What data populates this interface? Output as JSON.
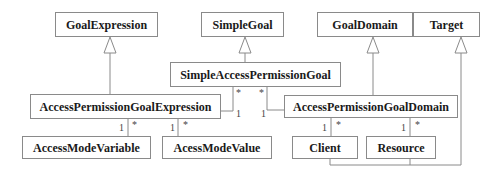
{
  "diagram": {
    "type": "uml-class-diagram",
    "classes": [
      {
        "id": "goal_expression",
        "name": "GoalExpression"
      },
      {
        "id": "simple_goal",
        "name": "SimpleGoal"
      },
      {
        "id": "goal_domain",
        "name": "GoalDomain"
      },
      {
        "id": "target",
        "name": "Target"
      },
      {
        "id": "simple_access_permission_goal",
        "name": "SimpleAccessPermissionGoal"
      },
      {
        "id": "access_permission_goal_expression",
        "name": "AccessPermissionGoalExpression"
      },
      {
        "id": "access_permission_goal_domain",
        "name": "AccessPermissionGoalDomain"
      },
      {
        "id": "access_mode_variable",
        "name": "AccessModeVariable"
      },
      {
        "id": "access_mode_value",
        "name": "AcessModeValue"
      },
      {
        "id": "client",
        "name": "Client"
      },
      {
        "id": "resource",
        "name": "Resource"
      }
    ],
    "generalizations": [
      {
        "child": "AccessPermissionGoalExpression",
        "parent": "GoalExpression"
      },
      {
        "child": "SimpleAccessPermissionGoal",
        "parent": "SimpleGoal"
      },
      {
        "child": "AccessPermissionGoalDomain",
        "parent": "GoalDomain"
      },
      {
        "child": "Client",
        "parent": "Target"
      },
      {
        "child": "Resource",
        "parent": "Target"
      }
    ],
    "associations": [
      {
        "from": "SimpleAccessPermissionGoal",
        "to": "AccessPermissionGoalExpression",
        "mult_near_from": "*",
        "mult_near_to": "1"
      },
      {
        "from": "SimpleAccessPermissionGoal",
        "to": "AccessPermissionGoalDomain",
        "mult_near_from": "*",
        "mult_near_to": "1"
      },
      {
        "from": "AccessPermissionGoalExpression",
        "to": "AccessModeVariable",
        "mult_left": "1",
        "mult_right": "*"
      },
      {
        "from": "AccessPermissionGoalExpression",
        "to": "AcessModeValue",
        "mult_left": "1",
        "mult_right": "*"
      },
      {
        "from": "AccessPermissionGoalDomain",
        "to": "Client",
        "mult_left": "1",
        "mult_right": "*"
      },
      {
        "from": "AccessPermissionGoalDomain",
        "to": "Resource",
        "mult_left": "1",
        "mult_right": "*"
      }
    ],
    "multiplicities": {
      "one": "1",
      "many": "*"
    }
  }
}
